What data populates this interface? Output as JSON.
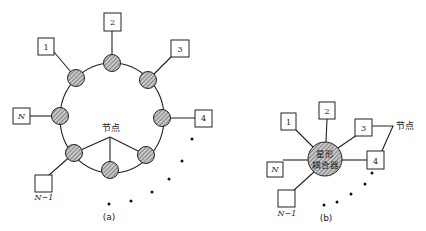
{
  "diagram_a": {
    "caption": "(a)",
    "node_label": "节点",
    "stations": [
      {
        "label": "1"
      },
      {
        "label": "2"
      },
      {
        "label": "3"
      },
      {
        "label": "4"
      },
      {
        "label": "N"
      },
      {
        "label": "N−1"
      }
    ],
    "topology": "ring"
  },
  "diagram_b": {
    "caption": "(b)",
    "node_label": "节点",
    "coupler_line1": "星形",
    "coupler_line2": "耦合器",
    "stations": [
      {
        "label": "1"
      },
      {
        "label": "2"
      },
      {
        "label": "3"
      },
      {
        "label": "4"
      },
      {
        "label": "N"
      },
      {
        "label": "N−1"
      }
    ],
    "topology": "star"
  },
  "colors": {
    "stroke": "#222222",
    "node_fill": "#b9b9b9",
    "background": "#ffffff"
  }
}
